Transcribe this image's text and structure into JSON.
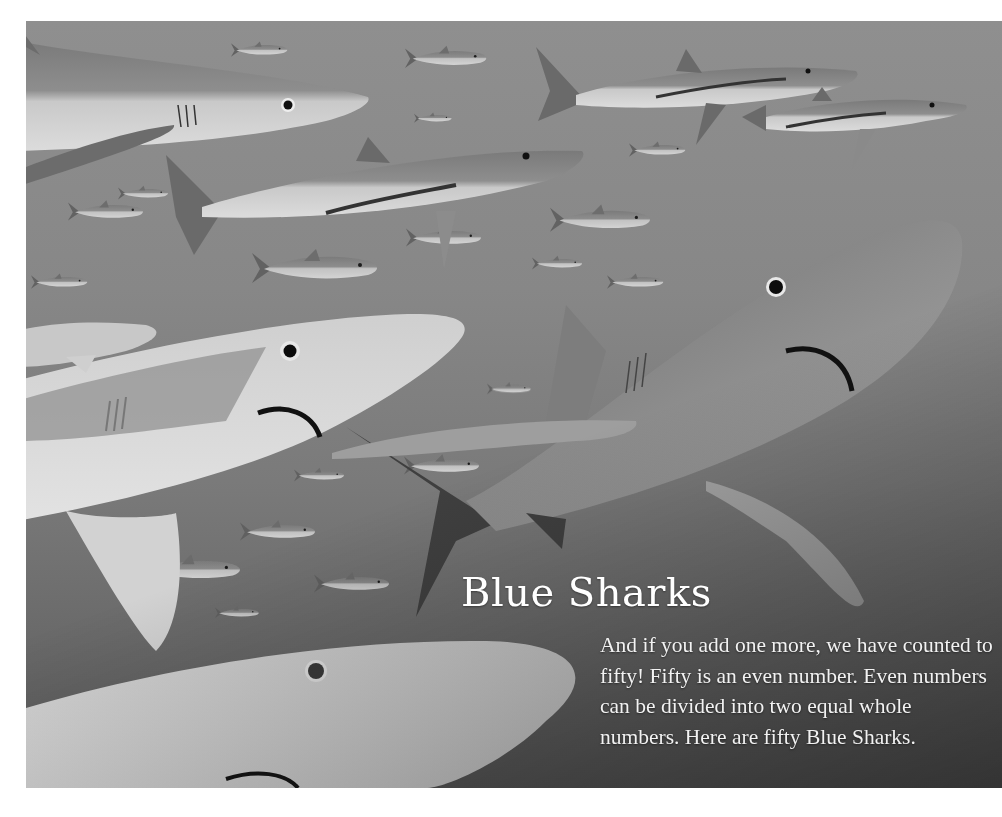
{
  "page": {
    "title": "Blue Sharks",
    "body": "And if you add one more, we have counted to fifty! Fifty is an even number. Even numbers can be divided into two equal whole numbers. Here are fifty Blue Sharks."
  },
  "illustration": {
    "subject": "school of blue sharks",
    "style": "grayscale pencil illustration",
    "colors": {
      "water_light": "#8f8f8f",
      "water_dark": "#5a5a5a",
      "shark_back": "#7b7b7b",
      "shark_belly": "#d6d6d6",
      "text": "#ffffff"
    }
  }
}
